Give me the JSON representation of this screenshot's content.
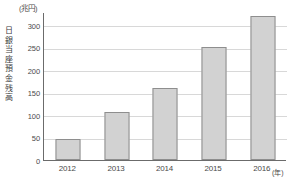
{
  "chart_data": {
    "type": "bar",
    "title": "",
    "subtitle": "",
    "unit_y": "(兆円)",
    "unit_x": "(年)",
    "ylabel": "日銀当座預金残高",
    "xlabel": "",
    "categories": [
      "2012",
      "2013",
      "2014",
      "2015",
      "2016"
    ],
    "values": [
      47,
      107,
      160,
      253,
      320
    ],
    "yticks": [
      0,
      50,
      100,
      150,
      200,
      250,
      300
    ],
    "ytick_labels": [
      "0",
      "50",
      "100",
      "150",
      "200",
      "250",
      "300"
    ],
    "ylim": [
      0,
      330
    ],
    "grid": true,
    "legend": null,
    "series": [
      {
        "name": "日銀当座預金残高",
        "values": [
          47,
          107,
          160,
          253,
          320
        ]
      }
    ],
    "colors": {
      "bar_fill": "#d2d2d2",
      "bar_stroke": "#8e8e8e",
      "axis": "#6b6b6b",
      "gridline": "#d8d8d8",
      "text": "#4a4a4a",
      "background": "#ffffff"
    }
  }
}
